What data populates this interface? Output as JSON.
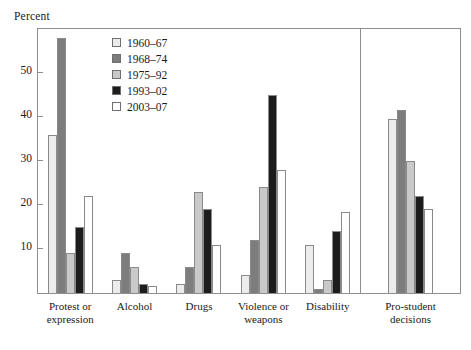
{
  "chart_data": {
    "type": "bar",
    "title": "",
    "subtitle": "",
    "xlabel": "",
    "ylabel": "Percent",
    "ylim": [
      0,
      60
    ],
    "yticks": [
      10,
      20,
      30,
      40,
      50
    ],
    "ytick_labels": [
      "10",
      "20",
      "30",
      "40",
      "50"
    ],
    "grid": false,
    "legend_position": "upper-left-inside",
    "categories": [
      "Protest or expression",
      "Alcohol",
      "Drugs",
      "Violence or weapons",
      "Disability",
      "Pro-student decisions"
    ],
    "category_lines": [
      [
        "Protest or",
        "expression"
      ],
      [
        "Alcohol"
      ],
      [
        "Drugs"
      ],
      [
        "Violence or",
        "weapons"
      ],
      [
        "Disability"
      ],
      [
        "Pro-student",
        "decisions"
      ]
    ],
    "series": [
      {
        "name": "1960–67",
        "color": "#ececec",
        "values": [
          36,
          3,
          2,
          4,
          11,
          39.5
        ]
      },
      {
        "name": "1968–74",
        "color": "#7d7d7d",
        "values": [
          58,
          9,
          6,
          12,
          1,
          41.5
        ]
      },
      {
        "name": "1975–92",
        "color": "#c9c9c9",
        "values": [
          9,
          6,
          23,
          24,
          3,
          30
        ]
      },
      {
        "name": "1993–02",
        "color": "#1c1c1c",
        "values": [
          15,
          2,
          19,
          45,
          14,
          22
        ]
      },
      {
        "name": "2003–07",
        "color": "#ffffff",
        "values": [
          22,
          1.5,
          11,
          28,
          18.5,
          19
        ]
      }
    ],
    "panel_break_after_category": "Disability",
    "annotations": []
  },
  "legend": {
    "entries": [
      {
        "label": "1960–67",
        "color": "#ececec"
      },
      {
        "label": "1968–74",
        "color": "#7d7d7d"
      },
      {
        "label": "1975–92",
        "color": "#c9c9c9"
      },
      {
        "label": "1993–02",
        "color": "#1c1c1c"
      },
      {
        "label": "2003–07",
        "color": "#ffffff"
      }
    ]
  },
  "style": {
    "frame_color": "#8e8e8e",
    "bar_outline_color": "#8a8a8a",
    "text_color": "#1a1a1a",
    "background": "#ffffff"
  }
}
